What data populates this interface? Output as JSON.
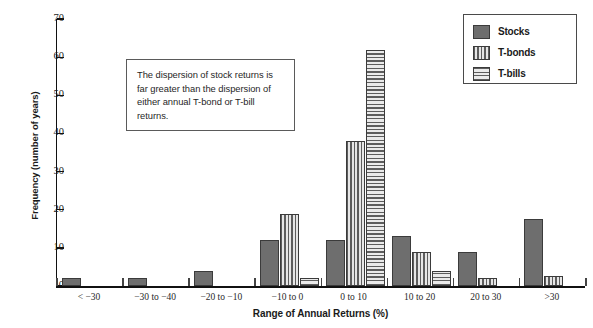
{
  "chart_data": {
    "type": "bar",
    "title": "",
    "xlabel": "Range of Annual Returns (%)",
    "ylabel": "Frequency (number of years)",
    "categories": [
      "< −30",
      "−30 to −40",
      "−20 to −10",
      "−10 to 0",
      "0 to 10",
      "10 to 20",
      "20 to 30",
      ">30"
    ],
    "series": [
      {
        "name": "Stocks",
        "values": [
          2,
          2,
          4,
          12,
          12,
          13,
          9,
          17.5
        ]
      },
      {
        "name": "T-bonds",
        "values": [
          0,
          0,
          0,
          19,
          38,
          9,
          2,
          2.5
        ]
      },
      {
        "name": "T-bills",
        "values": [
          0,
          0,
          0,
          2,
          62,
          4,
          0,
          0
        ]
      }
    ],
    "ylim": [
      0,
      70
    ],
    "yticks": [
      0,
      10,
      20,
      30,
      40,
      50,
      60,
      70
    ],
    "ytick_labels": [
      "0",
      "10",
      "20",
      "30",
      "40",
      "50",
      "60",
      "70"
    ],
    "grid": false,
    "legend_position": "top-right",
    "colors": {
      "stocks": "#6e6e6e",
      "tbonds_stripe": "#5d5d5d",
      "tbills_stripe": "#5d5d5d",
      "axis": "#111111",
      "background": "#ffffff"
    }
  },
  "legend": {
    "items": [
      {
        "label": "Stocks",
        "pattern": "solid"
      },
      {
        "label": "T-bonds",
        "pattern": "vertical-stripes"
      },
      {
        "label": "T-bills",
        "pattern": "horizontal-stripes"
      }
    ]
  },
  "annotation": {
    "text": "The dispersion of stock returns is far greater than the dispersion of either annual T-bond or T-bill returns."
  }
}
